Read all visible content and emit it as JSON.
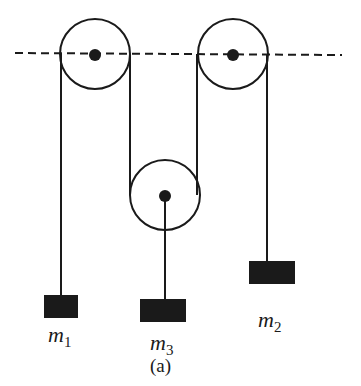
{
  "diagram": {
    "caption": "(a)",
    "reference_line": "dashed horizontal line through fixed pulley centers",
    "pulleys": [
      {
        "id": "left-fixed",
        "cx": 95,
        "cy": 54,
        "r": 35
      },
      {
        "id": "right-fixed",
        "cx": 233,
        "cy": 54,
        "r": 35
      },
      {
        "id": "middle-movable",
        "cx": 165,
        "cy": 195,
        "r": 35
      }
    ],
    "masses": [
      {
        "id": "m1",
        "symbol": "m",
        "subscript": "1",
        "x": 44,
        "y": 295,
        "w": 34,
        "h": 23
      },
      {
        "id": "m3",
        "symbol": "m",
        "subscript": "3",
        "x": 140,
        "y": 299,
        "w": 46,
        "h": 23
      },
      {
        "id": "m2",
        "symbol": "m",
        "subscript": "2",
        "x": 249,
        "y": 261,
        "w": 46,
        "h": 23
      }
    ],
    "colors": {
      "ink": "#1a1a1a",
      "background": "#ffffff"
    }
  }
}
